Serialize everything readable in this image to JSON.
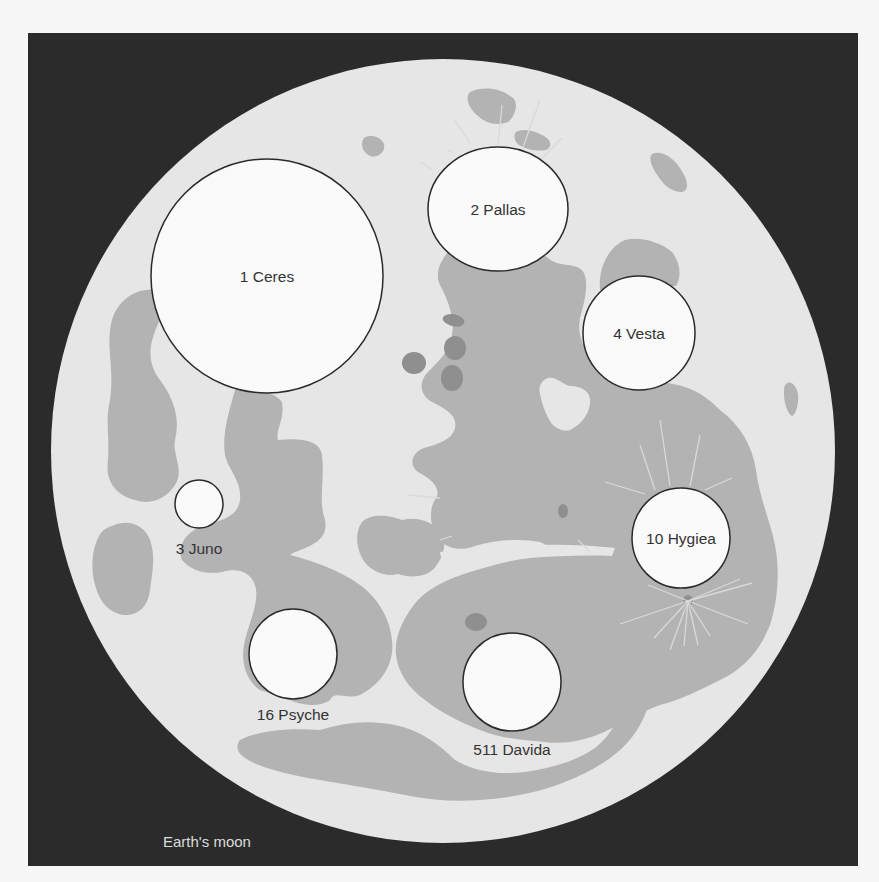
{
  "caption": "Earth's moon",
  "colors": {
    "page_bg": "#f7f7f7",
    "frame_bg": "#2b2b2b",
    "highlands": "#e6e6e6",
    "maria": "#b3b3b3",
    "dark_spots": "#8f8f8f",
    "asteroid_fill": "#fafafa",
    "asteroid_stroke": "#2a2a2a",
    "rays": "#d9d9d9",
    "label_text": "#333333",
    "caption_text": "#dcdcdc"
  },
  "moon": {
    "cx": 443,
    "cy": 451,
    "r": 392
  },
  "asteroids": [
    {
      "label": "1 Ceres",
      "cx": 267,
      "cy": 276,
      "rx": 116,
      "ry": 117,
      "label_x": 267,
      "label_y": 282,
      "label_pos": "inside"
    },
    {
      "label": "2 Pallas",
      "cx": 498,
      "cy": 209,
      "rx": 70,
      "ry": 62,
      "label_x": 498,
      "label_y": 215,
      "label_pos": "inside"
    },
    {
      "label": "4 Vesta",
      "cx": 639,
      "cy": 333,
      "rx": 56,
      "ry": 57,
      "label_x": 639,
      "label_y": 339,
      "label_pos": "inside"
    },
    {
      "label": "10 Hygiea",
      "cx": 681,
      "cy": 538,
      "rx": 49,
      "ry": 50,
      "label_x": 681,
      "label_y": 544,
      "label_pos": "inside"
    },
    {
      "label": "3 Juno",
      "cx": 199,
      "cy": 504,
      "rx": 24,
      "ry": 24,
      "label_x": 199,
      "label_y": 554,
      "label_pos": "below"
    },
    {
      "label": "16 Psyche",
      "cx": 293,
      "cy": 654,
      "rx": 44,
      "ry": 45,
      "label_x": 293,
      "label_y": 720,
      "label_pos": "below"
    },
    {
      "label": "511 Davida",
      "cx": 512,
      "cy": 682,
      "rx": 49,
      "ry": 49,
      "label_x": 512,
      "label_y": 755,
      "label_pos": "below"
    }
  ]
}
